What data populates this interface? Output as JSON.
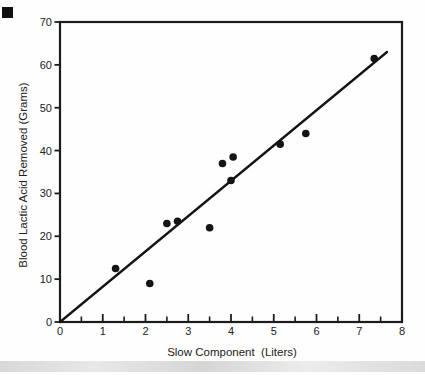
{
  "chart_data": {
    "type": "scatter",
    "title": "",
    "xlabel": "Slow Component  (Liters)",
    "ylabel": "Blood Lactic Acid Removed (Grams)",
    "xlim": [
      0,
      8
    ],
    "ylim": [
      0,
      70
    ],
    "x_ticks": [
      0,
      1,
      2,
      3,
      4,
      5,
      6,
      7,
      8
    ],
    "x_minor_step": 0.5,
    "y_ticks": [
      0,
      10,
      20,
      30,
      40,
      50,
      60,
      70
    ],
    "grid": false,
    "legend": false,
    "marker": "filled-circle",
    "marker_color": "#141414",
    "axis_color": "#1c1c1c",
    "points": [
      {
        "x": 1.3,
        "y": 12.5
      },
      {
        "x": 2.1,
        "y": 9
      },
      {
        "x": 2.5,
        "y": 23
      },
      {
        "x": 2.75,
        "y": 23.5
      },
      {
        "x": 3.5,
        "y": 22
      },
      {
        "x": 3.8,
        "y": 37
      },
      {
        "x": 4.0,
        "y": 33
      },
      {
        "x": 4.05,
        "y": 38.5
      },
      {
        "x": 5.15,
        "y": 41.5
      },
      {
        "x": 5.75,
        "y": 44
      },
      {
        "x": 7.35,
        "y": 61.5
      }
    ],
    "trendline": {
      "x1": 0,
      "y1": 0,
      "x2": 7.65,
      "y2": 63
    }
  },
  "artifacts": {
    "corner_mark_color": "#101010",
    "bottom_band_color": "#d4d4d4"
  }
}
